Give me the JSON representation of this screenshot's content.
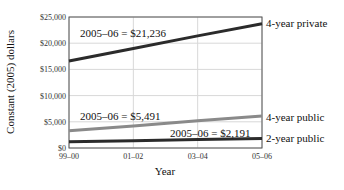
{
  "chart_data": {
    "type": "line",
    "title": "",
    "xlabel": "Year",
    "ylabel": "Constant (2005) dollars",
    "x": [
      "99–00",
      "01–02",
      "03–04",
      "05–06"
    ],
    "yticks": [
      "$0",
      "$5,000",
      "$10,000",
      "$15,000",
      "$20,000",
      "$25,000"
    ],
    "ylim": [
      0,
      25000
    ],
    "grid": true,
    "series": [
      {
        "name": "4-year private",
        "values": [
          16600,
          19000,
          21400,
          23700
        ],
        "color": "#2b2b2b",
        "annotation": "2005–06 = $21,236"
      },
      {
        "name": "4-year public",
        "values": [
          3300,
          4200,
          5200,
          6100
        ],
        "color": "#8a8a8a",
        "annotation": "2005–06 = $5,491"
      },
      {
        "name": "2-year public",
        "values": [
          1200,
          1400,
          1600,
          1800
        ],
        "color": "#2b2b2b",
        "annotation": "2005–06 = $2,191"
      }
    ]
  }
}
